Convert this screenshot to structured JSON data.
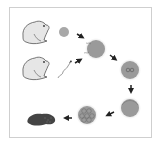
{
  "diagram": {
    "title": "",
    "colors": {
      "frame": "#cfcfcf",
      "frog_fill": "#e6e6e6",
      "frog_stroke": "#555555",
      "cell_fill": "#9a9a9a",
      "cell_halo": "#dcdcdc",
      "arrow": "#222222",
      "tadpole": "#444444"
    },
    "nodes": [
      {
        "id": "female-frog",
        "label": ""
      },
      {
        "id": "male-frog",
        "label": ""
      },
      {
        "id": "egg",
        "label": ""
      },
      {
        "id": "sperm",
        "label": ""
      },
      {
        "id": "fertilization",
        "label": ""
      },
      {
        "id": "zygote-two-nuclei",
        "label": ""
      },
      {
        "id": "zygote",
        "label": ""
      },
      {
        "id": "cleavage-blastula",
        "label": ""
      },
      {
        "id": "embryo-tadpole",
        "label": ""
      }
    ],
    "flow": [
      [
        "egg",
        "fertilization"
      ],
      [
        "sperm",
        "fertilization"
      ],
      [
        "fertilization",
        "zygote-two-nuclei"
      ],
      [
        "zygote-two-nuclei",
        "zygote"
      ],
      [
        "zygote",
        "cleavage-blastula"
      ],
      [
        "cleavage-blastula",
        "embryo-tadpole"
      ]
    ]
  }
}
